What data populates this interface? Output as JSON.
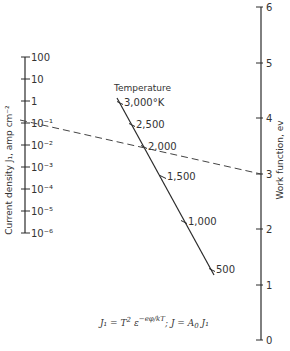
{
  "chart_data": {
    "type": "nomogram",
    "title": "",
    "axes": [
      {
        "name": "current_density",
        "label": "Current density J₁, amp cm⁻²",
        "scale": "log",
        "ticks": [
          {
            "value": 100,
            "label": "100",
            "y": 57
          },
          {
            "value": 10,
            "label": "10",
            "y": 79
          },
          {
            "value": 1,
            "label": "1",
            "y": 101
          },
          {
            "value": 0.1,
            "label": "10⁻¹",
            "y": 123
          },
          {
            "value": 0.01,
            "label": "10⁻²",
            "y": 145
          },
          {
            "value": 0.001,
            "label": "10⁻³",
            "y": 167
          },
          {
            "value": 0.0001,
            "label": "10⁻⁴",
            "y": 189
          },
          {
            "value": 1e-05,
            "label": "10⁻⁵",
            "y": 211
          },
          {
            "value": 1e-06,
            "label": "10⁻⁶",
            "y": 233
          }
        ]
      },
      {
        "name": "temperature",
        "label": "Temperature",
        "unit": "°K",
        "ticks": [
          {
            "value": 3000,
            "label": "3,000°K",
            "x": 120,
            "y": 103
          },
          {
            "value": 2500,
            "label": "2,500",
            "x": 132,
            "y": 125
          },
          {
            "value": 2000,
            "label": "2,000",
            "x": 144,
            "y": 147
          },
          {
            "value": 1500,
            "label": "1,500",
            "x": 163,
            "y": 177
          },
          {
            "value": 1000,
            "label": "1,000",
            "x": 184,
            "y": 222
          },
          {
            "value": 500,
            "label": "500",
            "x": 212,
            "y": 270
          }
        ]
      },
      {
        "name": "work_function",
        "label": "Work function, ev",
        "scale": "linear",
        "range": [
          0,
          6
        ],
        "ticks": [
          {
            "value": 6,
            "label": "6",
            "y": 7
          },
          {
            "value": 5,
            "label": "5",
            "y": 63
          },
          {
            "value": 4,
            "label": "4",
            "y": 118
          },
          {
            "value": 3,
            "label": "3",
            "y": 174
          },
          {
            "value": 2,
            "label": "2",
            "y": 229
          },
          {
            "value": 1,
            "label": "1",
            "y": 285
          },
          {
            "value": 0,
            "label": "0",
            "y": 340
          }
        ]
      }
    ],
    "example_isopleth": {
      "current_density": 0.1,
      "temperature": 2000,
      "work_function": 3,
      "style": "dashed"
    },
    "formula": "J₁ = T² ε^(−eφ/kT);  J = A₀ J₁"
  },
  "labels": {
    "left_axis": "Current density J₁, amp cm⁻²",
    "right_axis": "Work function, ev",
    "temperature": "Temperature",
    "formula_part1": "J₁ = T",
    "formula_sup2": "2",
    "formula_eps": "ε",
    "formula_exp": "−eφ/kT",
    "formula_part2": ";   J = A",
    "formula_sub0": "0",
    "formula_part3": " J₁"
  }
}
